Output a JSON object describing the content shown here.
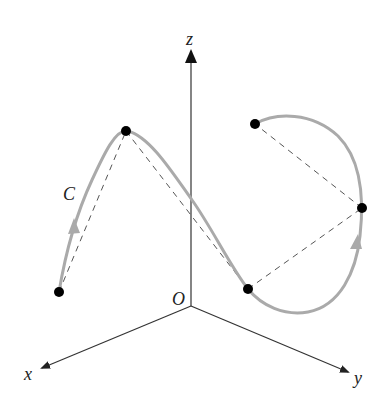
{
  "diagram": {
    "type": "3d-space-curve",
    "axes": {
      "origin_label": "O",
      "x_label": "x",
      "y_label": "y",
      "z_label": "z",
      "axis_color": "#222222"
    },
    "curve": {
      "label": "C",
      "color": "#aaaaaa",
      "points": [
        {
          "x": 59,
          "y": 292
        },
        {
          "x": 126,
          "y": 131
        },
        {
          "x": 248,
          "y": 289
        },
        {
          "x": 362,
          "y": 208
        },
        {
          "x": 255,
          "y": 124
        }
      ],
      "direction_arrows": 2
    },
    "chords": {
      "style": "dashed",
      "color": "#555555",
      "count": 4
    },
    "point_color": "#000000"
  }
}
